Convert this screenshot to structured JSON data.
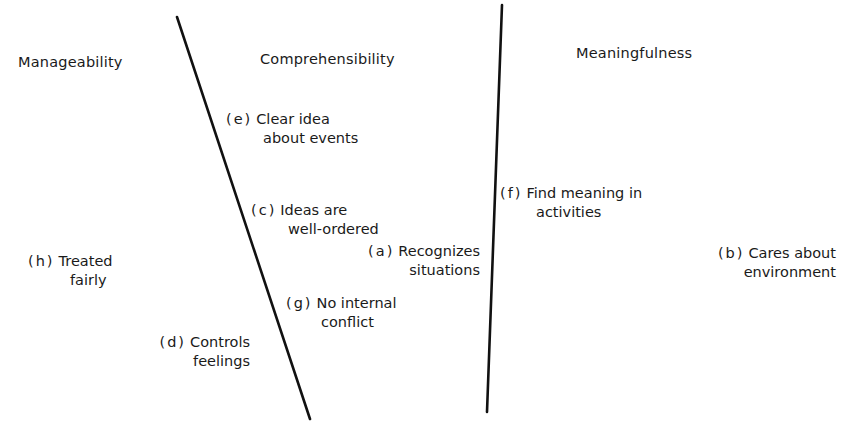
{
  "diagram": {
    "type": "three-region classification diagram",
    "dividers": [
      {
        "name": "divider-manageability-comprehensibility",
        "x1": 177,
        "y1": 17,
        "x2": 310,
        "y2": 419
      },
      {
        "name": "divider-comprehensibility-meaningfulness",
        "x1": 502,
        "y1": 5,
        "x2": 487,
        "y2": 412
      }
    ],
    "line_color": "#111111",
    "text_color": "#1a1a1a"
  },
  "headings": {
    "manageability": "Manageability",
    "comprehensibility": "Comprehensibility",
    "meaningfulness": "Meaningfulness"
  },
  "items": {
    "e": {
      "tag": "(e)",
      "line1": "Clear idea",
      "line2": "about events",
      "region": "Comprehensibility"
    },
    "c": {
      "tag": "(c)",
      "line1": "Ideas are",
      "line2": "well-ordered",
      "region": "Comprehensibility"
    },
    "a": {
      "tag": "(a)",
      "line1": "Recognizes",
      "line2": "situations",
      "region": "Comprehensibility"
    },
    "g": {
      "tag": "(g)",
      "line1": "No internal",
      "line2": "conflict",
      "region": "Comprehensibility"
    },
    "h": {
      "tag": "(h)",
      "line1": "Treated",
      "line2": "fairly",
      "region": "Manageability"
    },
    "d": {
      "tag": "(d)",
      "line1": "Controls",
      "line2": "feelings",
      "region": "Manageability"
    },
    "f": {
      "tag": "(f)",
      "line1": "Find meaning in",
      "line2": "activities",
      "region": "Meaningfulness"
    },
    "b": {
      "tag": "(b)",
      "line1": "Cares about",
      "line2": "environment",
      "region": "Meaningfulness"
    }
  }
}
